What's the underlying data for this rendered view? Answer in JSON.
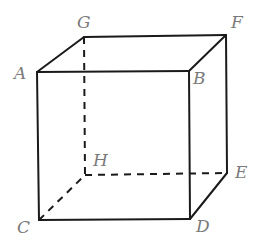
{
  "diagram": {
    "type": "cube",
    "vertices": {
      "A": {
        "label": "A",
        "x": 37,
        "y": 72,
        "lx": 14,
        "ly": 79
      },
      "B": {
        "label": "B",
        "x": 189,
        "y": 71,
        "lx": 193,
        "ly": 84
      },
      "C": {
        "label": "C",
        "x": 39,
        "y": 220,
        "lx": 17,
        "ly": 233
      },
      "D": {
        "label": "D",
        "x": 190,
        "y": 219,
        "lx": 196,
        "ly": 232
      },
      "E": {
        "label": "E",
        "x": 227,
        "y": 173,
        "lx": 235,
        "ly": 178
      },
      "F": {
        "label": "F",
        "x": 226,
        "y": 35,
        "lx": 231,
        "ly": 28
      },
      "G": {
        "label": "G",
        "x": 84,
        "y": 37,
        "lx": 77,
        "ly": 28
      },
      "H": {
        "label": "H",
        "x": 85,
        "y": 175,
        "lx": 93,
        "ly": 166
      }
    },
    "visible_edges": [
      [
        "A",
        "B"
      ],
      [
        "A",
        "G"
      ],
      [
        "G",
        "F"
      ],
      [
        "B",
        "F"
      ],
      [
        "A",
        "C"
      ],
      [
        "B",
        "D"
      ],
      [
        "F",
        "E"
      ],
      [
        "C",
        "D"
      ],
      [
        "D",
        "E"
      ]
    ],
    "hidden_edges": [
      [
        "G",
        "H"
      ],
      [
        "H",
        "E"
      ],
      [
        "C",
        "H"
      ]
    ],
    "colors": {
      "edge": "#1a1a1a",
      "label": "#7a7a7a",
      "background": "#ffffff"
    }
  }
}
